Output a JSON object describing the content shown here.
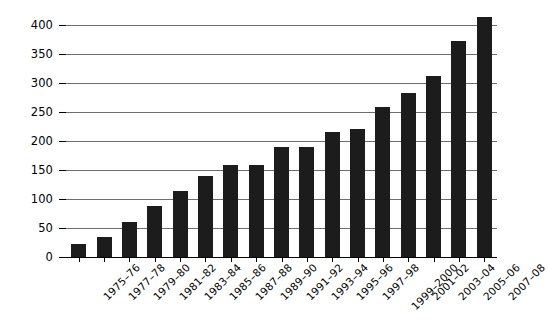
{
  "chart_data": {
    "type": "bar",
    "title": "",
    "subtitle": "",
    "xlabel": "",
    "ylabel": "",
    "ylim": [
      0,
      450
    ],
    "ytick_step": 50,
    "yticks": [
      0,
      50,
      100,
      150,
      200,
      250,
      300,
      350,
      400,
      450
    ],
    "grid": true,
    "legend": false,
    "legend_position": "none",
    "bar_color": "#1c1c1c",
    "gridline_color": "#6d6d6d",
    "axis_color": "#000000",
    "categories": [
      "1975–76",
      "1977–78",
      "1979–80",
      "1981–82",
      "1983–84",
      "1985–86",
      "1987–88",
      "1989–90",
      "1991–92",
      "1993–94",
      "1995–96",
      "1997–98",
      "1999–2000",
      "2001–02",
      "2003–04",
      "2005–06",
      "2007–08"
    ],
    "values": [
      22,
      35,
      60,
      88,
      113,
      140,
      158,
      158,
      190,
      190,
      215,
      220,
      258,
      282,
      312,
      372,
      414
    ]
  }
}
